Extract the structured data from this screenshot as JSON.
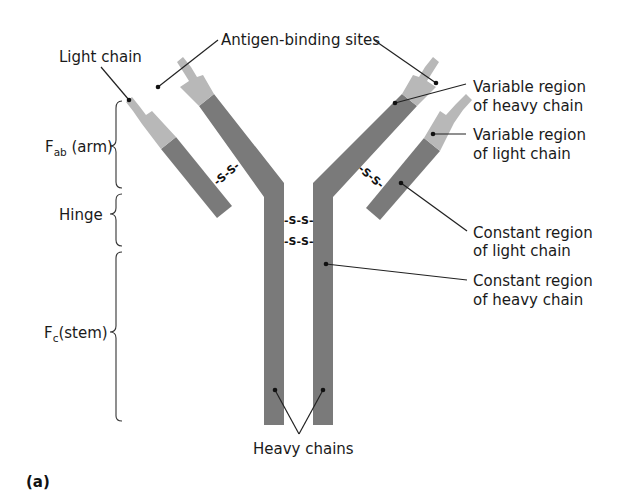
{
  "diagram": {
    "panel_label": "(a)",
    "colors": {
      "constant_region": "#7a7a7a",
      "variable_region": "#b8b8b8",
      "text": "#1a1a1a",
      "background": "#ffffff"
    },
    "labels": {
      "light_chain": "Light chain",
      "antigen_binding_sites": "Antigen-binding sites",
      "variable_heavy_line1": "Variable region",
      "variable_heavy_line2": "of heavy chain",
      "variable_light_line1": "Variable region",
      "variable_light_line2": "of light chain",
      "constant_light_line1": "Constant region",
      "constant_light_line2": "of light chain",
      "constant_heavy_line1": "Constant region",
      "constant_heavy_line2": "of heavy chain",
      "heavy_chains": "Heavy chains"
    },
    "brackets": {
      "fab": {
        "main": "F",
        "sub": "ab",
        "suffix": " (arm)"
      },
      "hinge": {
        "label": "Hinge"
      },
      "fc": {
        "main": "F",
        "sub": "c",
        "suffix": "(stem)"
      }
    },
    "disulfide_bond": "-S-S-",
    "disulfide_parts": {
      "s": "S",
      "dash": "-"
    }
  }
}
